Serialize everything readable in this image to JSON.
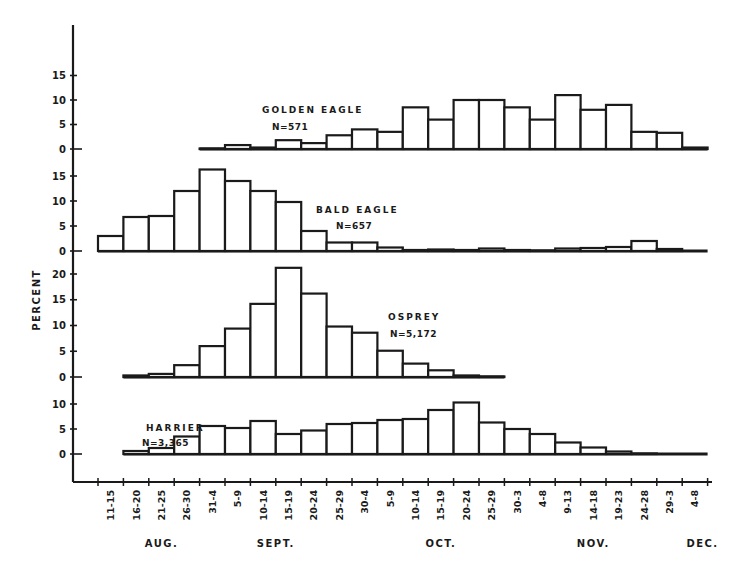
{
  "chart_data": {
    "type": "bar",
    "title": "",
    "ylabel": "PERCENT",
    "xlabel": "",
    "categories": [
      "11-15",
      "16-20",
      "21-25",
      "26-30",
      "31-4",
      "5-9",
      "10-14",
      "15-19",
      "20-24",
      "25-29",
      "30-4",
      "5-9",
      "10-14",
      "15-19",
      "20-24",
      "25-29",
      "30-3",
      "4-8",
      "9-13",
      "14-18",
      "19-23",
      "24-28",
      "29-3",
      "4-8"
    ],
    "months": [
      {
        "label": "AUG.",
        "center_index": 2
      },
      {
        "label": "SEPT.",
        "center_index": 6.5
      },
      {
        "label": "OCT.",
        "center_index": 13
      },
      {
        "label": "NOV.",
        "center_index": 19
      },
      {
        "label": "DEC.",
        "center_index": 23.3
      }
    ],
    "series": [
      {
        "name": "GOLDEN EAGLE",
        "n_label": "N=571",
        "yticks": [
          0,
          5,
          10,
          15
        ],
        "ylim": [
          0,
          15
        ],
        "start_index": 4,
        "end_index": 24,
        "values": [
          null,
          null,
          null,
          null,
          0.1,
          0.8,
          0.3,
          1.8,
          1.2,
          2.8,
          4.0,
          3.5,
          8.5,
          6.0,
          10.0,
          10.0,
          8.5,
          6.0,
          11.0,
          8.0,
          9.0,
          3.5,
          3.3,
          0.3
        ]
      },
      {
        "name": "BALD EAGLE",
        "n_label": "N=657",
        "yticks": [
          0,
          5,
          10,
          15
        ],
        "ylim": [
          0,
          15
        ],
        "start_index": 0,
        "end_index": 24,
        "values": [
          3.0,
          6.8,
          7.0,
          12.0,
          16.3,
          14.0,
          12.0,
          9.8,
          4.0,
          1.7,
          1.7,
          0.7,
          0.2,
          0.3,
          0.2,
          0.5,
          0.2,
          0.1,
          0.5,
          0.6,
          0.8,
          2.0,
          0.4,
          0.0
        ]
      },
      {
        "name": "OSPREY",
        "n_label": "N=5,172",
        "yticks": [
          0,
          5,
          10,
          15,
          20
        ],
        "ylim": [
          0,
          20
        ],
        "start_index": 1,
        "end_index": 16,
        "values": [
          null,
          0.3,
          0.6,
          2.3,
          6.0,
          9.4,
          14.2,
          21.2,
          16.2,
          9.8,
          8.6,
          5.1,
          2.6,
          1.3,
          0.3,
          0.1,
          null,
          null,
          null,
          null,
          null,
          null,
          null,
          null
        ]
      },
      {
        "name": "HARRIER",
        "n_label": "N=3,365",
        "yticks": [
          0,
          5,
          10
        ],
        "ylim": [
          0,
          10
        ],
        "start_index": 1,
        "end_index": 24,
        "values": [
          null,
          0.6,
          1.2,
          3.5,
          5.6,
          5.2,
          6.6,
          4.0,
          4.7,
          6.0,
          6.2,
          6.8,
          7.0,
          8.8,
          10.3,
          6.3,
          5.0,
          4.0,
          2.3,
          1.3,
          0.5,
          0.1,
          0.0,
          0.0
        ]
      }
    ],
    "grid": false,
    "legend_position": "inline-labels"
  }
}
